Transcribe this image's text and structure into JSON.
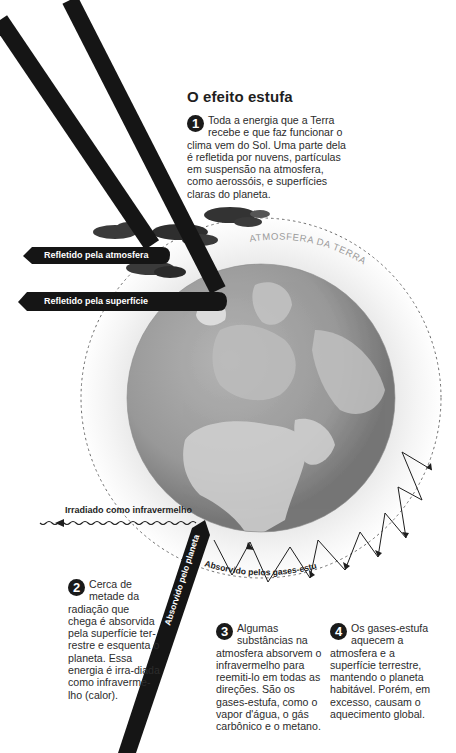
{
  "title": "O efeito estufa",
  "colors": {
    "beam": "#151515",
    "globe_dark": "#7a7a7a",
    "globe_light": "#c8c8c8",
    "atmosphere_ring": "#f2f2f2",
    "dashed_border": "#777777",
    "text": "#2c2c2c"
  },
  "steps": [
    {
      "number": "1",
      "text_first": "Toda a energia que a Terra recebe e que faz funcionar o",
      "text_rest": "clima vem do Sol. Uma parte dela é refletida por nuvens, partículas em suspensão na atmosfera, como aerossóis, e superfícies claras do planeta."
    },
    {
      "number": "2",
      "text_first": "Cerca de metade da radiação que",
      "text_rest": "chega é absorvida pela superfície ter-restre e esquenta o planeta. Essa energia é irra-diada como infraverme-lho (calor)."
    },
    {
      "number": "3",
      "text_first": "Algumas substâncias na",
      "text_rest": "atmosfera absorvem o infravermelho para reemiti-lo em todas as direções. São os gases-estufa, como o vapor d'água, o gás carbônico e o metano."
    },
    {
      "number": "4",
      "text_first": "Os gases-estufa aquecem a",
      "text_rest": "atmosfera e a superfície terrestre, mantendo o planeta habitável. Porém, em excesso, causam o aquecimento global."
    }
  ],
  "labels": {
    "reflected_atmosphere": "Refletido pela atmosfera",
    "reflected_surface": "Refletido pela superfície",
    "atmosphere": "ATMOSFERA DA TERRA",
    "radiated_infrared": "Irradiado como infravermelho",
    "absorbed_planet": "Absorvido pelo planeta",
    "absorbed_gases": "Absorvido pelos gases-estufa"
  },
  "icons": {
    "sun_beam": "incoming-sunlight-beam",
    "cloud": "cloud-icon",
    "globe": "earth-globe",
    "wavy_arrow": "infrared-wavy-arrow"
  }
}
